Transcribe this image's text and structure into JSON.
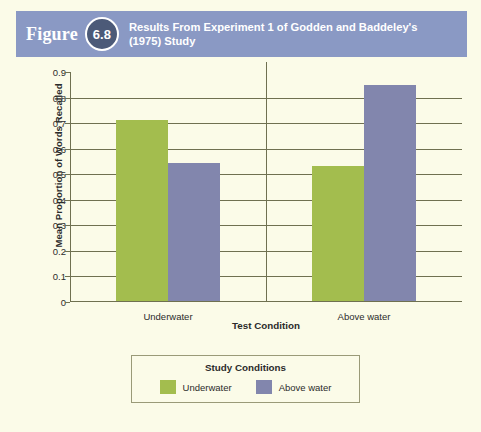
{
  "header": {
    "figure_word": "Figure",
    "figure_number": "6.8",
    "title": "Results From Experiment 1 of Godden and Baddeley's (1975) Study",
    "banner_color": "#8a99c4",
    "badge_color": "#4c5a78"
  },
  "page": {
    "background_color": "#fbfbe8"
  },
  "legend": {
    "title": "Study Conditions",
    "entries": [
      {
        "label": "Underwater",
        "color": "#a3bd4e"
      },
      {
        "label": "Above water",
        "color": "#8286ad"
      }
    ]
  },
  "chart_data": {
    "type": "bar",
    "title": "Results From Experiment 1 of Godden and Baddeley's (1975) Study",
    "xlabel": "Test Condition",
    "ylabel": "Mean Proportion of Words Recalled",
    "categories": [
      "Underwater",
      "Above water"
    ],
    "series": [
      {
        "name": "Underwater",
        "color": "#a3bd4e",
        "values": [
          0.71,
          0.53
        ]
      },
      {
        "name": "Above water",
        "color": "#8286ad",
        "values": [
          0.54,
          0.845
        ]
      }
    ],
    "ylim": [
      0,
      0.9
    ],
    "ytick_labels": [
      "0.9",
      "0.8",
      "0.7",
      "0.6",
      "0.5",
      "0.4",
      "0.3",
      "0.2",
      "0.1",
      "0"
    ],
    "ytick_values": [
      0.9,
      0.8,
      0.7,
      0.6,
      0.5,
      0.4,
      0.3,
      0.2,
      0.1,
      0
    ],
    "grid": true,
    "legend_position": "bottom",
    "group_separator": true
  }
}
